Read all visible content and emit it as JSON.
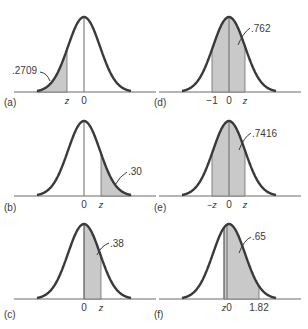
{
  "figure": {
    "colors": {
      "curve": "#3a3a3a",
      "shade": "#c9c9c9",
      "axis": "#6a6a6a",
      "text": "#3a3a3a"
    },
    "panels": [
      {
        "id": "(a)",
        "area_label": ".2709",
        "shade": "left-tail",
        "ticks": [
          "z",
          "0"
        ]
      },
      {
        "id": "(b)",
        "area_label": ".30",
        "shade": "right-tail",
        "ticks": [
          "0",
          "z"
        ]
      },
      {
        "id": "(c)",
        "area_label": ".38",
        "shade": "0-to-z",
        "ticks": [
          "0",
          "z"
        ]
      },
      {
        "id": "(d)",
        "area_label": ".762",
        "shade": "-1-to-z",
        "ticks": [
          "−1",
          "0",
          "z"
        ]
      },
      {
        "id": "(e)",
        "area_label": ".7416",
        "shade": "-z-to-z",
        "ticks": [
          "−z",
          "0",
          "z"
        ]
      },
      {
        "id": "(f)",
        "area_label": ".65",
        "shade": "z-to-1.82",
        "ticks": [
          "z",
          "0",
          "1.82"
        ]
      }
    ]
  }
}
